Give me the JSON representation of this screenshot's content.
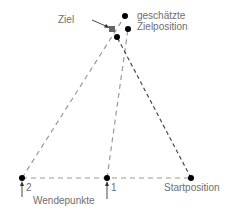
{
  "labels": {
    "target": "Ziel",
    "estimated_line1": "geschätzte",
    "estimated_line2": "Zielposition",
    "turn_points": "Wendepunkte",
    "start": "Startposition",
    "turn_1": "1",
    "turn_2": "2"
  },
  "colors": {
    "dots": "#000000",
    "dashed_light": "#9a9a9a",
    "dashed_dark": "#4a4a4a",
    "target_square": "#666666",
    "text": "#6e6e6e"
  }
}
